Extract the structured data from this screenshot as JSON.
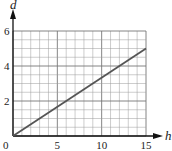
{
  "chart_data": {
    "type": "line",
    "title": "",
    "xlabel": "h",
    "ylabel": "d",
    "xlim": [
      0,
      15
    ],
    "ylim": [
      0,
      6
    ],
    "x_ticks": [
      0,
      5,
      10,
      15
    ],
    "y_ticks": [
      2,
      4,
      6
    ],
    "x_tick_labels": [
      "0",
      "5",
      "10",
      "15"
    ],
    "y_tick_labels": [
      "2",
      "4",
      "6"
    ],
    "grid": true,
    "grid_minor_x_step": 1,
    "grid_minor_y_step": 0.5,
    "grid_major_x_step": 5,
    "grid_major_y_step": 2,
    "legend": null,
    "series": [
      {
        "name": "d",
        "x": [
          0,
          15
        ],
        "y": [
          0,
          5
        ],
        "color": "#555555"
      }
    ],
    "colors": {
      "line": "#555555",
      "axis": "#111111",
      "grid": "#9a9a9a",
      "grid_major": "#777777"
    }
  }
}
